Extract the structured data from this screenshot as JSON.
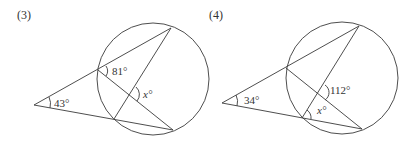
{
  "figures": [
    {
      "label": "(3)",
      "angles": {
        "external": "43°",
        "upper_vertex": "81°",
        "unknown": "x°"
      }
    },
    {
      "label": "(4)",
      "angles": {
        "external": "34°",
        "chord_intersection": "112°",
        "unknown": "x°"
      }
    }
  ],
  "colors": {
    "stroke": "#3a3a3a",
    "text": "#333333"
  }
}
